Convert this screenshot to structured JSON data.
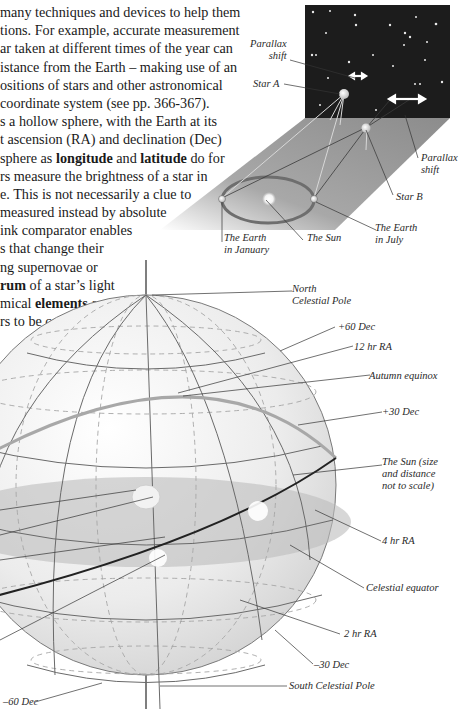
{
  "body_text": {
    "lines": [
      {
        "pre": "many techniques and devices to help them",
        "bold": "",
        "post": ""
      },
      {
        "pre": "tions. For example, accurate measurement",
        "bold": "",
        "post": ""
      },
      {
        "pre": "ar taken at different times of the year can",
        "bold": "",
        "post": ""
      },
      {
        "pre": "istance from the Earth – making use of an",
        "bold": "",
        "post": ""
      },
      {
        "pre": "ositions of stars and other astronomical",
        "bold": "",
        "post": ""
      },
      {
        "pre": "coordinate system (see pp. 366-367).",
        "bold": "",
        "post": ""
      },
      {
        "pre": "s a hollow sphere, with the Earth at its",
        "bold": "",
        "post": ""
      },
      {
        "pre": "t ascension (RA) and declination (Dec)",
        "bold": "",
        "post": ""
      },
      {
        "pre": " sphere as ",
        "bold": "longitude",
        "post": " and ",
        "bold2": "latitude",
        "post2": " do for"
      },
      {
        "pre": "rs measure the brightness of a star in",
        "bold": "",
        "post": ""
      },
      {
        "pre": "e. This is not necessarily a clue to",
        "bold": "",
        "post": ""
      },
      {
        "pre": "measured instead by absolute",
        "bold": "",
        "post": ""
      },
      {
        "pre": "ink comparator enables",
        "bold": "",
        "post": ""
      },
      {
        "pre": "s that change their",
        "bold": "",
        "post": ""
      },
      {
        "pre": "ng supernovae or",
        "bold": "",
        "post": ""
      },
      {
        "pre": "",
        "bold": "rum",
        "post": " of a star’s light"
      },
      {
        "pre": "mical ",
        "bold": "elements",
        "post": " are"
      },
      {
        "pre": "rs to be categorized",
        "bold": "",
        "post": ""
      }
    ]
  },
  "parallax_diagram": {
    "labels": {
      "parallax_shift_a": "Parallax\nshift",
      "star_a": "Star A",
      "parallax_shift_b": "Parallax\nshift",
      "star_b": "Star B",
      "earth_january": "The Earth\nin January",
      "sun": "The Sun",
      "earth_july": "The Earth\nin July"
    },
    "colors": {
      "sky": "#1c1c1c",
      "plane": "#9a9a9a",
      "star": "#e8e8e8"
    }
  },
  "celestial_sphere": {
    "labels": {
      "north_pole": "North\nCelestial Pole",
      "plus60": "+60 Dec",
      "ra12": "12 hr RA",
      "autumn_equinox": "Autumn equinox",
      "plus30": "+30 Dec",
      "sun": "The Sun (size\nand distance\nnot to scale)",
      "ra4": "4 hr RA",
      "celestial_equator": "Celestial equator",
      "ra2": "2 hr RA",
      "minus30": "–30 Dec",
      "south_pole": "South Celestial Pole",
      "minus60": "–60 Dec"
    },
    "colors": {
      "sphere": "#e4e4e4",
      "equator_plane": "#bdbdbd",
      "grid": "#6a6a6a",
      "ecliptic": "#222222"
    }
  }
}
